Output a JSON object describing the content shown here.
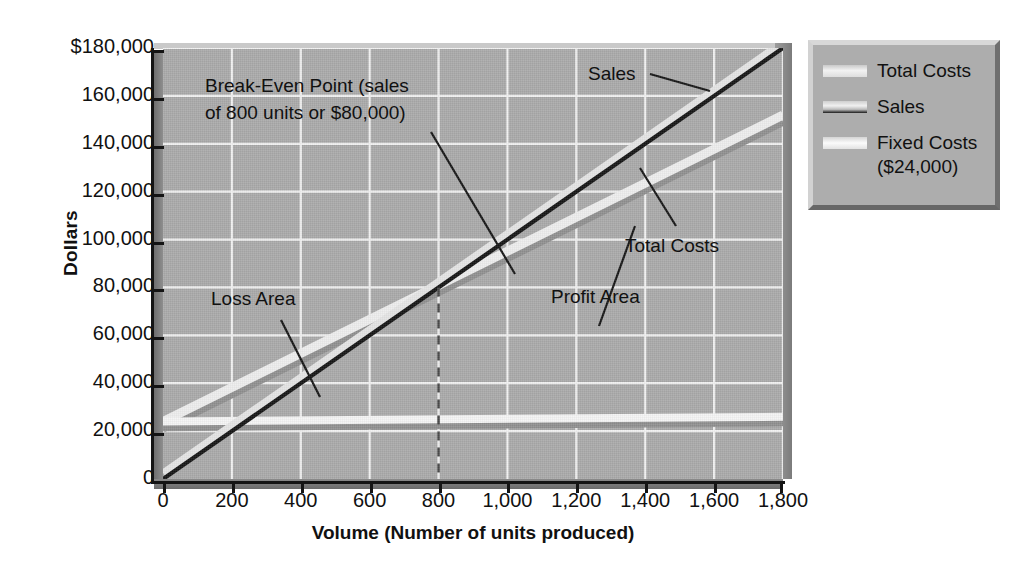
{
  "chart_data": {
    "type": "line",
    "title": "",
    "xlabel": "Volume (Number of units produced)",
    "ylabel": "Dollars",
    "xlim": [
      0,
      1800
    ],
    "ylim": [
      0,
      180000
    ],
    "grid": true,
    "legend_position": "right-outside",
    "x_ticks": [
      "0",
      "200",
      "400",
      "600",
      "800",
      "1,000",
      "1,200",
      "1,400",
      "1,600",
      "1,800"
    ],
    "x_tick_values": [
      0,
      200,
      400,
      600,
      800,
      1000,
      1200,
      1400,
      1600,
      1800
    ],
    "y_ticks": [
      "0",
      "20,000",
      "40,000",
      "60,000",
      "80,000",
      "100,000",
      "120,000",
      "140,000",
      "160,000",
      "$180,000"
    ],
    "y_tick_values": [
      0,
      20000,
      40000,
      60000,
      80000,
      100000,
      120000,
      140000,
      160000,
      180000
    ],
    "series": [
      {
        "name": "Sales",
        "color": "#141414",
        "x": [
          0,
          1800
        ],
        "values": [
          0,
          180000
        ]
      },
      {
        "name": "Total Costs",
        "color": "#ededed",
        "x": [
          0,
          1800
        ],
        "values": [
          24000,
          152000
        ]
      },
      {
        "name": "Fixed Costs",
        "color": "#f4f4f4",
        "x": [
          0,
          1800
        ],
        "values": [
          24000,
          26000
        ]
      }
    ],
    "annotations": [
      {
        "name": "break-even-note",
        "line1": "Break-Even Point (sales",
        "line2": "of 800 units or $80,000)"
      },
      {
        "name": "loss-area",
        "text": "Loss Area"
      },
      {
        "name": "profit-area",
        "text": "Profit Area"
      },
      {
        "name": "sales-callout",
        "text": "Sales"
      },
      {
        "name": "total-costs-callout",
        "text": "Total Costs"
      }
    ],
    "break_even": {
      "units": 800,
      "dollars": 80000
    }
  },
  "legend": {
    "items": [
      {
        "label": "Total Costs",
        "sub": ""
      },
      {
        "label": "Sales",
        "sub": ""
      },
      {
        "label": "Fixed Costs",
        "sub": "($24,000)"
      }
    ]
  },
  "colors": {
    "plot_background": "#a9a9a9",
    "gridline": "#f0f0f0",
    "axis": "#141414",
    "sales_line": "#141414",
    "total_costs_line": "#ededed",
    "fixed_costs_line": "#f4f4f4",
    "legend_background": "#adadad",
    "page_background": "#ffffff"
  }
}
